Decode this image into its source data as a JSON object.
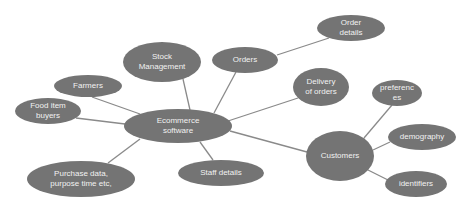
{
  "diagram": {
    "type": "mind-map",
    "colors": {
      "node_fill": "#747474",
      "node_text": "#f2f2f2",
      "edge": "#8a8a8a",
      "background": "#ffffff"
    },
    "nodes": [
      {
        "id": "ecommerce",
        "lines": [
          "Ecommerce",
          "software"
        ],
        "cx": 178,
        "cy": 126,
        "rx": 54,
        "ry": 17
      },
      {
        "id": "stock",
        "lines": [
          "Stock",
          "Management"
        ],
        "cx": 162,
        "cy": 62,
        "rx": 39,
        "ry": 20
      },
      {
        "id": "orders",
        "lines": [
          "Orders"
        ],
        "cx": 245,
        "cy": 60,
        "rx": 33,
        "ry": 13
      },
      {
        "id": "order_details",
        "lines": [
          "Order",
          "details"
        ],
        "cx": 351,
        "cy": 28,
        "rx": 34,
        "ry": 13
      },
      {
        "id": "farmers",
        "lines": [
          "Farmers"
        ],
        "cx": 88,
        "cy": 86,
        "rx": 34,
        "ry": 11
      },
      {
        "id": "food_buyers",
        "lines": [
          "Food item",
          "buyers"
        ],
        "cx": 48,
        "cy": 111,
        "rx": 33,
        "ry": 13
      },
      {
        "id": "delivery",
        "lines": [
          "Delivery",
          "of orders"
        ],
        "cx": 321,
        "cy": 87,
        "rx": 28,
        "ry": 19
      },
      {
        "id": "customers",
        "lines": [
          "Customers"
        ],
        "cx": 340,
        "cy": 156,
        "rx": 34,
        "ry": 25
      },
      {
        "id": "preferences",
        "lines": [
          "preferenc",
          "es"
        ],
        "cx": 397,
        "cy": 93,
        "rx": 25,
        "ry": 13
      },
      {
        "id": "demography",
        "lines": [
          "demography"
        ],
        "cx": 422,
        "cy": 137,
        "rx": 34,
        "ry": 13
      },
      {
        "id": "identifiers",
        "lines": [
          "identifiers"
        ],
        "cx": 416,
        "cy": 184,
        "rx": 31,
        "ry": 13
      },
      {
        "id": "staff",
        "lines": [
          "Staff details"
        ],
        "cx": 221,
        "cy": 173,
        "rx": 43,
        "ry": 13
      },
      {
        "id": "purchase",
        "lines": [
          "Purchase data,",
          "purpose time etc,"
        ],
        "cx": 81,
        "cy": 179,
        "rx": 54,
        "ry": 18
      }
    ],
    "edges": [
      {
        "from": "ecommerce",
        "to": "stock",
        "x1": 190,
        "y1": 110,
        "x2": 183,
        "y2": 79
      },
      {
        "from": "ecommerce",
        "to": "orders",
        "x1": 214,
        "y1": 113,
        "x2": 236,
        "y2": 72
      },
      {
        "from": "orders",
        "to": "order_details",
        "x1": 277,
        "y1": 55,
        "x2": 329,
        "y2": 38
      },
      {
        "from": "ecommerce",
        "to": "farmers",
        "x1": 140,
        "y1": 114,
        "x2": 92,
        "y2": 97
      },
      {
        "from": "ecommerce",
        "to": "food_buyers",
        "x1": 125,
        "y1": 124,
        "x2": 76,
        "y2": 118
      },
      {
        "from": "ecommerce",
        "to": "delivery",
        "x1": 228,
        "y1": 121,
        "x2": 298,
        "y2": 98
      },
      {
        "from": "ecommerce",
        "to": "customers",
        "x1": 230,
        "y1": 131,
        "x2": 307,
        "y2": 152
      },
      {
        "from": "ecommerce",
        "to": "staff",
        "x1": 200,
        "y1": 142,
        "x2": 213,
        "y2": 160
      },
      {
        "from": "ecommerce",
        "to": "purchase",
        "x1": 140,
        "y1": 139,
        "x2": 108,
        "y2": 163
      },
      {
        "from": "customers",
        "to": "preferences",
        "x1": 364,
        "y1": 138,
        "x2": 392,
        "y2": 105
      },
      {
        "from": "customers",
        "to": "demography",
        "x1": 373,
        "y1": 150,
        "x2": 390,
        "y2": 142
      },
      {
        "from": "customers",
        "to": "identifiers",
        "x1": 368,
        "y1": 170,
        "x2": 388,
        "y2": 180
      }
    ]
  }
}
